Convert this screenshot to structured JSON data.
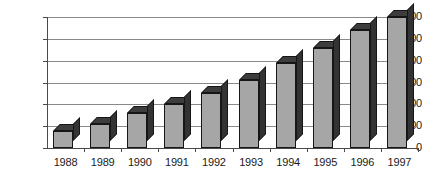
{
  "chart_data": {
    "type": "bar",
    "title": "",
    "subtitle": "",
    "xlabel": "",
    "ylabel": "",
    "categories": [
      "1988",
      "1989",
      "1990",
      "1991",
      "1992",
      "1993",
      "1994",
      "1995",
      "1996",
      "1997"
    ],
    "values": [
      800,
      1100,
      1600,
      2000,
      2500,
      3100,
      3900,
      4600,
      5400,
      6000
    ],
    "series": [
      {
        "name": "",
        "values": [
          800,
          1100,
          1600,
          2000,
          2500,
          3100,
          3900,
          4600,
          5400,
          6000
        ]
      }
    ],
    "ylim": [
      0,
      6000
    ],
    "yticks": [
      0,
      1000,
      2000,
      3000,
      4000,
      5000,
      6000
    ],
    "ytick_labels": [
      "0",
      "1,000",
      "2,000",
      "3,000",
      "4,000",
      "5,000",
      "6,000"
    ],
    "grid": true,
    "grid_axis": "y",
    "legend": false,
    "legend_position": "none",
    "style": "3d-column",
    "colors": {
      "bar_front": "#a6a6a6",
      "bar_side": "#333333",
      "bar_top": "#3d3d3d",
      "bar_outline": "#161616",
      "gridline": "#8a8a8a",
      "axis": "#4a4a4a",
      "text": "#1a1a1a",
      "background": "#ffffff"
    }
  }
}
